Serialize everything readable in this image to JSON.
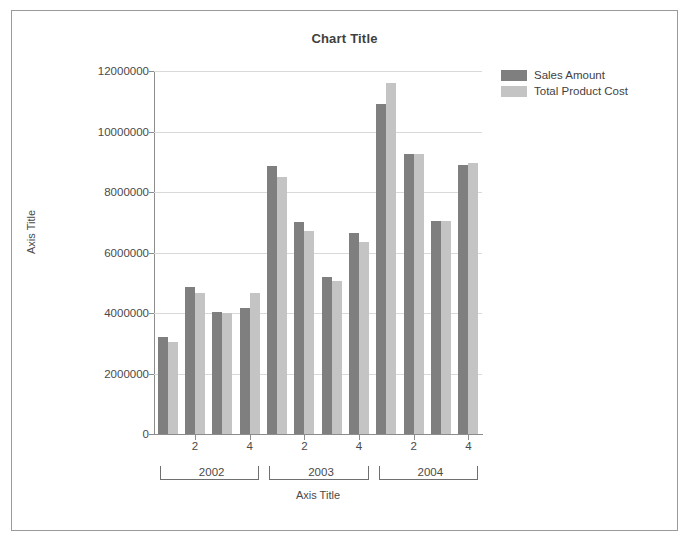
{
  "chart": {
    "title": "Chart Title",
    "x_axis_title": "Axis Title",
    "y_axis_title": "Axis Title"
  },
  "legend": {
    "items": [
      {
        "label": "Sales Amount",
        "color": "#7f7f7f"
      },
      {
        "label": "Total Product Cost",
        "color": "#c4c4c4"
      }
    ]
  },
  "chart_data": {
    "type": "bar",
    "title": "Chart Title",
    "xlabel": "Axis Title",
    "ylabel": "Axis Title",
    "ylim": [
      0,
      12000000
    ],
    "ytick_labels": [
      "0",
      "2000000",
      "4000000",
      "6000000",
      "8000000",
      "10000000",
      "12000000"
    ],
    "ytick_values": [
      0,
      2000000,
      4000000,
      6000000,
      8000000,
      10000000,
      12000000
    ],
    "grid": true,
    "legend_position": "right-top",
    "group_labels": [
      "2002",
      "2003",
      "2004"
    ],
    "categories": [
      "1",
      "2",
      "3",
      "4",
      "1",
      "2",
      "3",
      "4",
      "1",
      "2",
      "3",
      "4"
    ],
    "visible_tick_labels": [
      "",
      "2",
      "",
      "4",
      "",
      "2",
      "",
      "4",
      "",
      "2",
      "",
      "4"
    ],
    "series": [
      {
        "name": "Sales Amount",
        "color": "#7f7f7f",
        "values": [
          3200000,
          4850000,
          4050000,
          4150000,
          8850000,
          7000000,
          5200000,
          6650000,
          10900000,
          9250000,
          7050000,
          8900000
        ]
      },
      {
        "name": "Total Product Cost",
        "color": "#c4c4c4",
        "values": [
          3050000,
          4650000,
          4000000,
          4650000,
          8500000,
          6700000,
          5050000,
          6350000,
          11600000,
          9250000,
          7050000,
          8950000
        ]
      }
    ]
  }
}
